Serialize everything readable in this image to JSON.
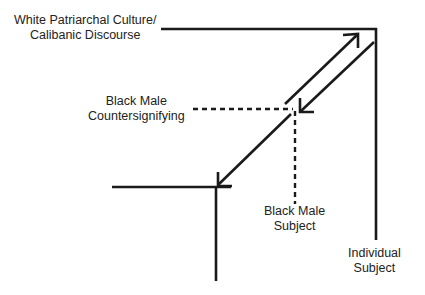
{
  "diagram": {
    "labels": {
      "white_patriarchal": {
        "line1": "White Patriarchal Culture/",
        "line2": "Calibanic Discourse"
      },
      "black_male_countersignifying": {
        "line1": "Black Male",
        "line2": "Countersignifying"
      },
      "black_male_subject": {
        "line1": "Black Male",
        "line2": "Subject"
      },
      "individual_subject": {
        "line1": "Individual",
        "line2": "Subject"
      }
    },
    "colors": {
      "line": "#1a1a1a",
      "background": "#ffffff"
    }
  }
}
